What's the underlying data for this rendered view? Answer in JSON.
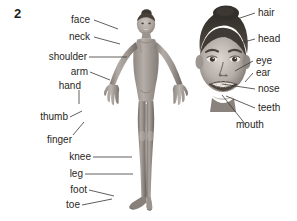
{
  "exercise": {
    "number": "2"
  },
  "figure": {
    "kind": "labelled-photo-diagram",
    "tone": "grayscale photograph"
  },
  "photos": [
    {
      "name": "full-body-photo",
      "alt": "Girl standing with arms out in a leotard"
    },
    {
      "name": "face-photo",
      "alt": "Close-up of girl's smiling face"
    }
  ],
  "labels_left": [
    {
      "id": "face",
      "text": "face"
    },
    {
      "id": "neck",
      "text": "neck"
    },
    {
      "id": "shoulder",
      "text": "shoulder"
    },
    {
      "id": "arm",
      "text": "arm"
    },
    {
      "id": "hand",
      "text": "hand"
    },
    {
      "id": "thumb",
      "text": "thumb"
    },
    {
      "id": "finger",
      "text": "finger"
    },
    {
      "id": "knee",
      "text": "knee"
    },
    {
      "id": "leg",
      "text": "leg"
    },
    {
      "id": "foot",
      "text": "foot"
    },
    {
      "id": "toe",
      "text": "toe"
    }
  ],
  "labels_right": [
    {
      "id": "hair",
      "text": "hair"
    },
    {
      "id": "head",
      "text": "head"
    },
    {
      "id": "eye",
      "text": "eye"
    },
    {
      "id": "ear",
      "text": "ear"
    },
    {
      "id": "nose",
      "text": "nose"
    },
    {
      "id": "teeth",
      "text": "teeth"
    },
    {
      "id": "mouth",
      "text": "mouth"
    }
  ],
  "colors": {
    "background": "#ffffff",
    "text": "#2a2724",
    "number": "#231f20",
    "leader_line": "#3a3734"
  }
}
